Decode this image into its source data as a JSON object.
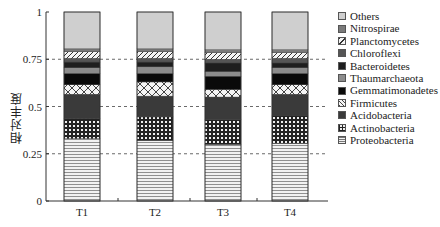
{
  "chart_data": {
    "type": "bar",
    "stacked": true,
    "title": "",
    "xlabel": "",
    "ylabel": "相对丰度",
    "ylim": [
      0,
      1
    ],
    "yticks": [
      "0",
      "0.25",
      "0.5",
      "0.75",
      "1"
    ],
    "gridlines": "dashed horizontal at 0.25, 0.5, 0.75",
    "legend_position": "right",
    "categories": [
      "T1",
      "T2",
      "T3",
      "T4"
    ],
    "series": [
      {
        "name": "Proteobacteria",
        "pattern": "horizontal-lines",
        "values": [
          0.33,
          0.32,
          0.3,
          0.305
        ]
      },
      {
        "name": "Actinobacteria",
        "pattern": "grid-dark",
        "values": [
          0.105,
          0.125,
          0.13,
          0.145
        ]
      },
      {
        "name": "Acidobacteria",
        "pattern": "solid-dark-gray",
        "values": [
          0.13,
          0.11,
          0.12,
          0.115
        ]
      },
      {
        "name": "Firmicutes",
        "pattern": "crosshatch-light",
        "values": [
          0.05,
          0.075,
          0.04,
          0.05
        ]
      },
      {
        "name": "Gemmatimonadetes",
        "pattern": "solid-black",
        "values": [
          0.06,
          0.045,
          0.07,
          0.06
        ]
      },
      {
        "name": "Thaumarchaeota",
        "pattern": "solid-mid-gray",
        "values": [
          0.03,
          0.035,
          0.025,
          0.03
        ]
      },
      {
        "name": "Bacteroidetes",
        "pattern": "solid-near-black",
        "values": [
          0.03,
          0.025,
          0.045,
          0.025
        ]
      },
      {
        "name": "Chloroflexi",
        "pattern": "solid-dark-gray-2",
        "values": [
          0.02,
          0.02,
          0.02,
          0.025
        ]
      },
      {
        "name": "Planctomycetes",
        "pattern": "diagonal-lines",
        "values": [
          0.035,
          0.035,
          0.035,
          0.03
        ]
      },
      {
        "name": "Nitrospirae",
        "pattern": "solid-gray",
        "values": [
          0.015,
          0.015,
          0.015,
          0.015
        ]
      },
      {
        "name": "Others",
        "pattern": "solid-light-gray",
        "values": [
          0.195,
          0.195,
          0.2,
          0.2
        ]
      }
    ]
  },
  "legend": {
    "items": [
      "Others",
      "Nitrospirae",
      "Planctomycetes",
      "Chloroflexi",
      "Bacteroidetes",
      "Thaumarchaeota",
      "Gemmatimonadetes",
      "Firmicutes",
      "Acidobacteria",
      "Actinobacteria",
      "Proteobacteria"
    ]
  }
}
